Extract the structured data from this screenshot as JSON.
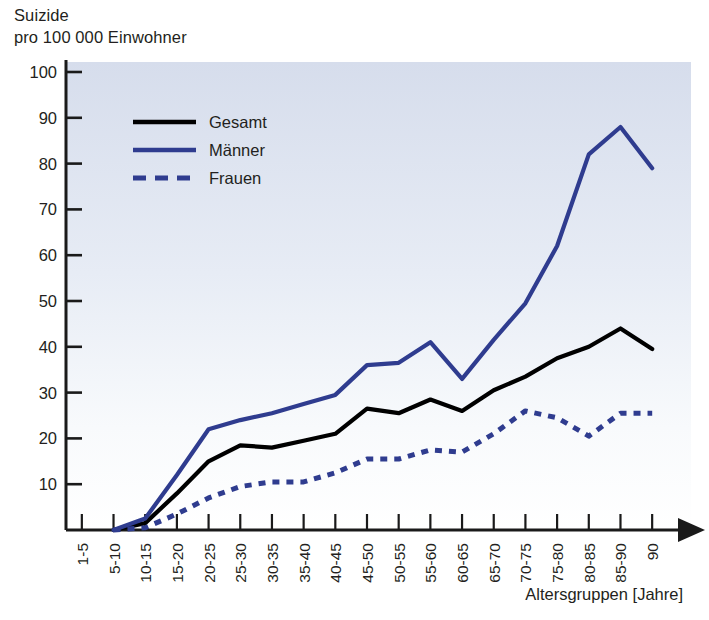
{
  "figure": {
    "title_line1": "Suizide",
    "title_line2": "pro 100 000 Einwohner",
    "xaxis_caption": "Altersgruppen [Jahre]",
    "colors": {
      "male_blue": "#2f3c8f",
      "total_black": "#000000",
      "female_blue_dashed": "#2f3c8f",
      "axis": "#1a1a1a",
      "plot_bg_top": "#d8dfec",
      "plot_bg_bottom": "#ffffff"
    }
  },
  "legend": {
    "position": "inside-top-left",
    "entries": [
      {
        "label": "Gesamt",
        "style": "solid",
        "color": "#000000"
      },
      {
        "label": "Männer",
        "style": "solid",
        "color": "#2f3c8f"
      },
      {
        "label": "Frauen",
        "style": "dashed",
        "color": "#2f3c8f"
      }
    ]
  },
  "chart_data": {
    "type": "line",
    "title": "Suizide pro 100 000 Einwohner",
    "subtitle": "",
    "xlabel": "Altersgruppen [Jahre]",
    "ylabel": "Suizide pro 100 000 Einwohner",
    "grid": false,
    "legend_position": "upper left (inside axes)",
    "ylim": [
      0,
      103
    ],
    "yticks": [
      10,
      20,
      30,
      40,
      50,
      60,
      70,
      80,
      90,
      100
    ],
    "categories": [
      "1-5",
      "5-10",
      "10-15",
      "15-20",
      "20-25",
      "25-30",
      "30-35",
      "35-40",
      "40-45",
      "45-50",
      "50-55",
      "55-60",
      "60-65",
      "65-70",
      "70-75",
      "75-80",
      "80-85",
      "85-90",
      "90"
    ],
    "x_axis_has_arrow": true,
    "series": [
      {
        "name": "Gesamt",
        "color": "#000000",
        "style": "solid",
        "values": [
          null,
          0,
          1.5,
          8,
          15,
          18.5,
          18,
          19.5,
          21,
          26.5,
          25.5,
          28.5,
          26,
          30.5,
          33.5,
          37.5,
          40,
          44,
          39.5
        ]
      },
      {
        "name": "Männer",
        "color": "#2f3c8f",
        "style": "solid",
        "values": [
          null,
          0,
          2.5,
          12,
          22,
          24,
          25.5,
          27.5,
          29.5,
          36,
          36.5,
          41,
          33,
          41.5,
          49.5,
          62,
          82,
          88,
          79
        ]
      },
      {
        "name": "Frauen",
        "color": "#2f3c8f",
        "style": "dashed",
        "values": [
          null,
          0,
          0.5,
          3.5,
          7,
          9.5,
          10.5,
          10.5,
          12.5,
          15.5,
          15.5,
          17.5,
          17,
          21,
          26,
          24.5,
          20.5,
          25.5,
          25.5
        ]
      }
    ]
  }
}
